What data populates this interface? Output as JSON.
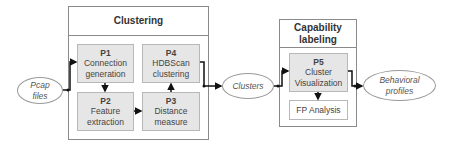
{
  "inputs": {
    "pcap": {
      "line1": "Pcap",
      "line2": "files"
    }
  },
  "clustering": {
    "title": "Clustering",
    "processes": [
      {
        "id": "P1",
        "line1": "Connection",
        "line2": "generation"
      },
      {
        "id": "P2",
        "line1": "Feature",
        "line2": "extraction"
      },
      {
        "id": "P3",
        "line1": "Distance",
        "line2": "measure"
      },
      {
        "id": "P4",
        "line1": "HDBScan",
        "line2": "clustering"
      }
    ]
  },
  "intermediate": {
    "clusters": "Clusters"
  },
  "capability_labeling": {
    "title_line1": "Capability",
    "title_line2": "labeling",
    "processes": [
      {
        "id": "P5",
        "line1": "Cluster",
        "line2": "Visualization"
      },
      {
        "id": "",
        "label": "FP Analysis"
      }
    ]
  },
  "outputs": {
    "behavioral": {
      "line1": "Behavioral",
      "line2": "profiles"
    }
  },
  "colors": {
    "process_fill": "#e6e6e6",
    "border": "#8a8a8a",
    "arrow": "#111111"
  }
}
